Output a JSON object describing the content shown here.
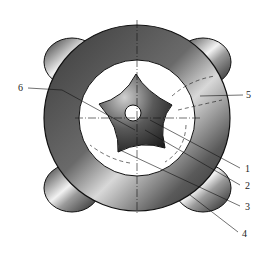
{
  "diagram": {
    "type": "mechanical cross-section",
    "labels": [
      {
        "id": "1",
        "text": "1",
        "x": 245,
        "y": 172
      },
      {
        "id": "2",
        "text": "2",
        "x": 245,
        "y": 189
      },
      {
        "id": "3",
        "text": "3",
        "x": 245,
        "y": 210
      },
      {
        "id": "4",
        "text": "4",
        "x": 242,
        "y": 237
      },
      {
        "id": "5",
        "text": "5",
        "x": 246,
        "y": 98
      },
      {
        "id": "6",
        "text": "6",
        "x": 18,
        "y": 91
      }
    ],
    "colors": {
      "metal_dark": "#2e2e2e",
      "metal_mid": "#8a8a8a",
      "metal_light": "#e6e6e6",
      "line": "#1a1a1a",
      "background": "#ffffff"
    }
  }
}
